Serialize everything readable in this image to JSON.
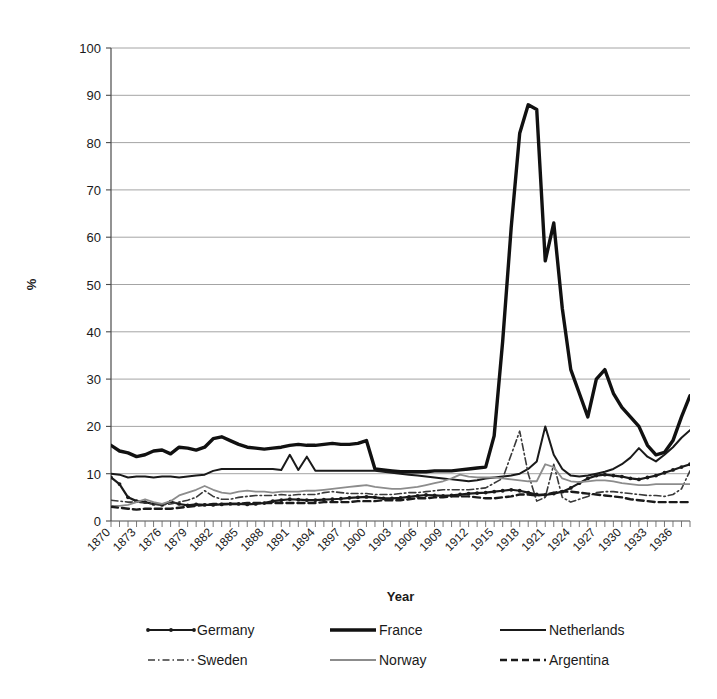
{
  "chart_data": {
    "type": "line",
    "title": "",
    "xlabel": "Year",
    "ylabel": "%",
    "ylim": [
      0,
      100
    ],
    "ytick_step": 10,
    "yticks": [
      0,
      10,
      20,
      30,
      40,
      50,
      60,
      70,
      80,
      90,
      100
    ],
    "grid": true,
    "grid_axis": "y",
    "legend_position": "bottom",
    "legend_columns": 3,
    "xlim": [
      1870,
      1938
    ],
    "x_tick_label_step": 3,
    "x_tick_label_rotation": -45,
    "xtick_labels": [
      "1870",
      "1873",
      "1876",
      "1879",
      "1882",
      "1885",
      "1888",
      "1891",
      "1894",
      "1897",
      "1900",
      "1903",
      "1906",
      "1909",
      "1912",
      "1915",
      "1918",
      "1921",
      "1924",
      "1927",
      "1930",
      "1933",
      "1936"
    ],
    "x": [
      1870,
      1871,
      1872,
      1873,
      1874,
      1875,
      1876,
      1877,
      1878,
      1879,
      1880,
      1881,
      1882,
      1883,
      1884,
      1885,
      1886,
      1887,
      1888,
      1889,
      1890,
      1891,
      1892,
      1893,
      1894,
      1895,
      1896,
      1897,
      1898,
      1899,
      1900,
      1901,
      1902,
      1903,
      1904,
      1905,
      1906,
      1907,
      1908,
      1909,
      1910,
      1911,
      1912,
      1913,
      1914,
      1915,
      1916,
      1917,
      1918,
      1919,
      1920,
      1921,
      1922,
      1923,
      1924,
      1925,
      1926,
      1927,
      1928,
      1929,
      1930,
      1931,
      1932,
      1933,
      1934,
      1935,
      1936,
      1937,
      1938
    ],
    "series": [
      {
        "name": "Germany",
        "style": "solid-marker",
        "color": "#1a1a1a",
        "width": 2.2,
        "markers": true,
        "values": [
          9.2,
          7.8,
          5.0,
          4.2,
          4.0,
          3.6,
          3.4,
          4.1,
          3.6,
          3.3,
          3.5,
          3.4,
          3.4,
          3.5,
          3.6,
          3.6,
          3.5,
          3.6,
          3.8,
          4.2,
          4.4,
          4.6,
          4.5,
          4.4,
          4.4,
          4.5,
          4.6,
          4.7,
          4.9,
          5.0,
          5.1,
          5.0,
          4.8,
          4.8,
          4.9,
          5.1,
          5.3,
          5.5,
          5.4,
          5.3,
          5.4,
          5.6,
          5.8,
          5.9,
          6.0,
          6.2,
          6.4,
          6.6,
          6.4,
          6.0,
          5.6,
          5.5,
          5.8,
          6.2,
          7.0,
          8.0,
          9.0,
          9.6,
          9.8,
          9.6,
          9.4,
          9.0,
          8.8,
          9.2,
          9.6,
          10.2,
          10.8,
          11.4,
          12.0
        ]
      },
      {
        "name": "France",
        "style": "solid-thick",
        "color": "#111111",
        "width": 3.4,
        "markers": false,
        "values": [
          16.0,
          14.8,
          14.4,
          13.6,
          14.0,
          14.8,
          15.0,
          14.2,
          15.6,
          15.4,
          15.0,
          15.6,
          17.4,
          17.8,
          17.0,
          16.2,
          15.6,
          15.4,
          15.2,
          15.4,
          15.6,
          16.0,
          16.2,
          16.0,
          16.0,
          16.2,
          16.4,
          16.2,
          16.2,
          16.4,
          17.0,
          11.0,
          10.8,
          10.6,
          10.4,
          10.4,
          10.4,
          10.4,
          10.6,
          10.6,
          10.6,
          10.8,
          11.0,
          11.2,
          11.4,
          18.0,
          38.0,
          62.0,
          82.0,
          88.0,
          87.0,
          55.0,
          63.0,
          45.0,
          32.0,
          27.0,
          22.0,
          30.0,
          32.0,
          27.0,
          24.0,
          22.0,
          20.0,
          16.0,
          14.0,
          14.5,
          17.0,
          22.0,
          26.5
        ]
      },
      {
        "name": "Netherlands",
        "style": "solid",
        "color": "#1a1a1a",
        "width": 2.0,
        "markers": false,
        "values": [
          10.0,
          9.8,
          9.2,
          9.4,
          9.4,
          9.2,
          9.4,
          9.4,
          9.2,
          9.4,
          9.6,
          9.8,
          10.6,
          11.0,
          11.0,
          11.0,
          11.0,
          11.0,
          11.0,
          11.0,
          10.8,
          14.0,
          10.8,
          13.6,
          10.6,
          10.6,
          10.6,
          10.6,
          10.6,
          10.6,
          10.6,
          10.6,
          10.4,
          10.2,
          10.0,
          9.8,
          9.6,
          9.4,
          9.2,
          9.0,
          8.8,
          8.6,
          8.4,
          8.6,
          9.0,
          9.2,
          9.4,
          9.6,
          10.0,
          11.0,
          12.6,
          20.0,
          14.0,
          11.0,
          9.6,
          9.4,
          9.6,
          10.0,
          10.4,
          11.0,
          12.0,
          13.4,
          15.4,
          13.6,
          12.6,
          14.0,
          15.6,
          17.6,
          19.2
        ]
      },
      {
        "name": "Sweden",
        "style": "dashdot",
        "color": "#3a3a3a",
        "width": 1.6,
        "markers": false,
        "values": [
          4.4,
          4.2,
          4.0,
          4.0,
          3.8,
          3.6,
          3.4,
          3.6,
          4.0,
          4.4,
          5.0,
          6.4,
          5.2,
          4.6,
          4.6,
          5.0,
          5.2,
          5.4,
          5.4,
          5.4,
          5.6,
          5.4,
          5.6,
          5.6,
          5.6,
          6.0,
          6.2,
          6.0,
          5.8,
          5.8,
          5.8,
          5.6,
          5.6,
          5.6,
          5.8,
          6.0,
          6.0,
          6.2,
          6.4,
          6.6,
          6.6,
          6.6,
          6.6,
          6.8,
          7.0,
          8.0,
          9.0,
          14.0,
          19.0,
          10.0,
          4.2,
          5.0,
          12.0,
          5.0,
          4.0,
          4.6,
          5.2,
          6.0,
          6.2,
          6.2,
          6.0,
          5.8,
          5.6,
          5.4,
          5.4,
          5.2,
          5.6,
          6.8,
          10.6
        ]
      },
      {
        "name": "Norway",
        "style": "solid-light",
        "color": "#8c8c8c",
        "width": 1.8,
        "markers": false,
        "values": [
          3.2,
          3.2,
          3.4,
          4.0,
          4.6,
          4.0,
          3.6,
          4.2,
          5.4,
          6.0,
          6.6,
          7.4,
          6.6,
          6.0,
          5.8,
          6.2,
          6.4,
          6.2,
          6.2,
          6.0,
          6.2,
          6.2,
          6.2,
          6.4,
          6.4,
          6.6,
          6.8,
          7.0,
          7.2,
          7.4,
          7.6,
          7.2,
          7.0,
          6.8,
          6.8,
          7.0,
          7.2,
          7.6,
          8.0,
          8.4,
          9.0,
          9.8,
          9.4,
          9.2,
          9.2,
          9.2,
          9.0,
          8.8,
          8.6,
          8.4,
          8.4,
          12.0,
          11.4,
          9.0,
          8.4,
          8.2,
          8.4,
          8.6,
          8.6,
          8.4,
          8.0,
          7.8,
          7.6,
          7.6,
          7.8,
          7.8,
          7.8,
          7.8,
          7.8
        ]
      },
      {
        "name": "Argentina",
        "style": "dashed",
        "color": "#1a1a1a",
        "width": 2.4,
        "markers": false,
        "values": [
          3.0,
          2.8,
          2.6,
          2.4,
          2.6,
          2.6,
          2.6,
          2.6,
          2.8,
          3.0,
          3.2,
          3.4,
          3.6,
          3.6,
          3.6,
          3.6,
          3.8,
          3.8,
          3.8,
          3.8,
          3.8,
          3.8,
          3.8,
          3.8,
          3.8,
          4.0,
          4.0,
          4.0,
          4.0,
          4.2,
          4.2,
          4.2,
          4.4,
          4.4,
          4.4,
          4.6,
          4.8,
          4.8,
          5.0,
          5.0,
          5.2,
          5.2,
          5.2,
          5.0,
          4.8,
          4.8,
          5.0,
          5.2,
          5.6,
          5.6,
          5.4,
          5.6,
          6.0,
          6.2,
          6.2,
          6.0,
          5.8,
          5.6,
          5.4,
          5.2,
          5.0,
          4.6,
          4.4,
          4.2,
          4.0,
          4.0,
          4.0,
          4.0,
          4.0
        ]
      }
    ]
  },
  "axes": {
    "y_title": "%",
    "x_title": "Year"
  },
  "legend": {
    "entries": [
      {
        "label": "Germany",
        "style": "solid-marker"
      },
      {
        "label": "France",
        "style": "solid-thick"
      },
      {
        "label": "Netherlands",
        "style": "solid"
      },
      {
        "label": "Sweden",
        "style": "dashdot"
      },
      {
        "label": "Norway",
        "style": "solid-light"
      },
      {
        "label": "Argentina",
        "style": "dashed"
      }
    ]
  }
}
